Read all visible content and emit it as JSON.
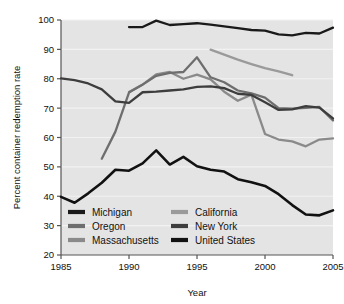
{
  "chart_data": {
    "type": "line",
    "title": "",
    "xlabel": "Year",
    "ylabel": "Percent container redemption rate",
    "xlim": [
      1985,
      2005
    ],
    "ylim": [
      20,
      100
    ],
    "xticks": [
      1985,
      1990,
      1995,
      2000,
      2005
    ],
    "yticks": [
      20,
      30,
      40,
      50,
      60,
      70,
      80,
      90,
      100
    ],
    "grid": true,
    "legend_position": "inside-bottom-left",
    "series": [
      {
        "name": "Michigan",
        "color": "#1a1a1a",
        "width": 2.3,
        "x": [
          1990,
          1991,
          1992,
          1993,
          1994,
          1995,
          1996,
          1997,
          1998,
          1999,
          2000,
          2001,
          2002,
          2003,
          2004,
          2005
        ],
        "values": [
          97.6,
          97.6,
          99.8,
          98.3,
          98.6,
          98.9,
          98.4,
          97.8,
          97.2,
          96.6,
          96.4,
          95.1,
          94.8,
          95.6,
          95.4,
          97.4
        ]
      },
      {
        "name": "Oregon",
        "color": "#6e6e6e",
        "width": 2.3,
        "x": [
          1988,
          1989,
          1990,
          1991,
          1992,
          1993,
          1994,
          1995,
          1996,
          1997,
          1998,
          1999,
          2000,
          2001,
          2002,
          2003,
          2004,
          2005
        ],
        "values": [
          52.8,
          62.0,
          75.3,
          78.0,
          81.0,
          82.0,
          82.3,
          87.3,
          80.5,
          78.8,
          76.0,
          75.0,
          73.6,
          70.0,
          69.8,
          70.1,
          70.4,
          65.8
        ]
      },
      {
        "name": "Massachusetts",
        "color": "#8a8a8a",
        "width": 2.3,
        "x": [
          1990,
          1991,
          1992,
          1993,
          1994,
          1995,
          1996,
          1997,
          1998,
          1999,
          2000,
          2001,
          2002,
          2003,
          2004,
          2005
        ],
        "values": [
          75.5,
          78.0,
          81.5,
          82.3,
          80.0,
          81.4,
          79.8,
          75.6,
          72.5,
          74.6,
          61.2,
          59.3,
          58.7,
          57.0,
          59.3,
          59.7
        ]
      },
      {
        "name": "California",
        "color": "#9a9a9a",
        "width": 2.3,
        "x": [
          1996,
          1997,
          1998,
          1999,
          2000,
          2001,
          2002
        ],
        "values": [
          89.9,
          88.2,
          86.5,
          85.0,
          83.6,
          82.5,
          81.2
        ]
      },
      {
        "name": "New York",
        "color": "#3d3d3d",
        "width": 2.3,
        "x": [
          1985,
          1986,
          1987,
          1988,
          1989,
          1990,
          1991,
          1992,
          1993,
          1994,
          1995,
          1996,
          1997,
          1998,
          1999,
          2000,
          2001,
          2002,
          2003,
          2004,
          2005
        ],
        "values": [
          80.1,
          79.5,
          78.4,
          76.4,
          72.3,
          71.8,
          75.4,
          75.6,
          76.0,
          76.4,
          77.2,
          77.4,
          76.8,
          74.9,
          74.5,
          72.0,
          69.4,
          69.6,
          70.7,
          70.2,
          66.5
        ]
      },
      {
        "name": "United States",
        "color": "#111111",
        "width": 2.6,
        "x": [
          1985,
          1986,
          1987,
          1988,
          1989,
          1990,
          1991,
          1992,
          1993,
          1994,
          1995,
          1996,
          1997,
          1998,
          1999,
          2000,
          2001,
          2002,
          2003,
          2004,
          2005
        ],
        "values": [
          39.8,
          37.8,
          41.0,
          44.6,
          49.0,
          48.7,
          51.2,
          55.6,
          50.8,
          53.4,
          50.2,
          49.0,
          48.4,
          45.8,
          44.8,
          43.5,
          40.7,
          37.0,
          33.8,
          33.5,
          35.2
        ]
      }
    ]
  },
  "axes": {
    "x_title": "Year",
    "y_title": "Percent container redemption rate",
    "x_tick_labels": [
      "1985",
      "1990",
      "1995",
      "2000",
      "2005"
    ],
    "y_tick_labels": [
      "20",
      "30",
      "40",
      "50",
      "60",
      "70",
      "80",
      "90",
      "100"
    ]
  },
  "legend": {
    "entries": [
      {
        "label": "Michigan",
        "color": "#1a1a1a",
        "column": 0,
        "row": 0
      },
      {
        "label": "Oregon",
        "color": "#6e6e6e",
        "column": 0,
        "row": 1
      },
      {
        "label": "Massachusetts",
        "color": "#8a8a8a",
        "column": 0,
        "row": 2
      },
      {
        "label": "California",
        "color": "#9a9a9a",
        "column": 1,
        "row": 0
      },
      {
        "label": "New York",
        "color": "#3d3d3d",
        "column": 1,
        "row": 1
      },
      {
        "label": "United States",
        "color": "#111111",
        "column": 1,
        "row": 2
      }
    ]
  },
  "style": {
    "plot_background": "#e4e4e4",
    "grid_color": "#f2f2f2",
    "axis_color": "#555555",
    "text_color": "#111111"
  }
}
